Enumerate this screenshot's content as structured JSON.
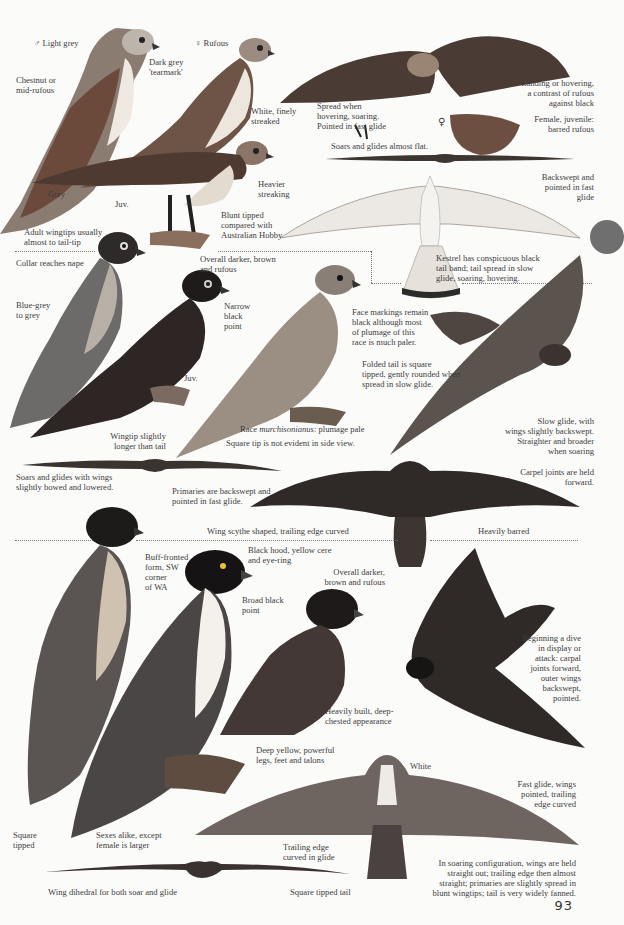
{
  "page": {
    "number": "93",
    "tab_color": "#6f6f6f",
    "ink_color": "#3c3c3c",
    "background": "#fbfbfa"
  },
  "section_kestrel": {
    "male_label": "♂ Light grey",
    "female_label": "♀ Rufous",
    "tearmark": "Dark grey\n'tearmark'",
    "chestnut": "Chestnut or\nmid-rufous",
    "white_streaked": "White, finely\nstreaked",
    "heavier_streaking": "Heavier\nstreaking",
    "grey": "Grey",
    "juv": "Juv.",
    "adult_wingtips": "Adult wingtips usually\nalmost to tail-tip",
    "blunt_tipped": "Blunt tipped\ncompared with\nAustralian Hobby",
    "spread_hovering": "Spread when\nhovering, soaring.\nPointed in fast glide",
    "female_symbol": "♀",
    "landing_hovering": "Landing or hovering,\na contrast of rufous\nagainst black",
    "female_juvenile": "Female, juvenile:\nbarred rufous",
    "soars_flat": "Soars and glides almost flat.",
    "backswept": "Backswept and\npointed in fast\nglide",
    "kestrel_tail": "Kestrel has conspicuous black\ntail band; tail spread in slow\nglide, soaring, hovering."
  },
  "section_hobby": {
    "collar": "Collar reaches nape",
    "overall_darker": "Overall darker, brown\nand rufous",
    "blue_grey": "Blue-grey\nto grey",
    "narrow_black_point": "Narrow\nblack\npoint",
    "juv": "Juv.",
    "face_markings": "Face markings remain\nblack although most\nof plumage of this\nrace is much paler.",
    "folded_tail": "Folded tail is square\ntipped, gently rounded when\nspread in slow glide.",
    "race_prefix": "Race ",
    "race_name": "murchisonianus",
    "race_suffix": ": plumage pale",
    "wingtip_longer": "Wingtip slightly\nlonger than tail",
    "square_tip": "Square tip is not evident in side view.",
    "slow_glide": "Slow glide, with\nwings slightly backswept.\nStraighter and broader\nwhen soaring",
    "soars_bowed": "Soars and glides with wings\nslightly bowed and lowered.",
    "primaries": "Primaries are backswept and\npointed in fast glide.",
    "carpel": "Carpel joints are held\nforward.",
    "scythe": "Wing scythe shaped, trailing edge curved",
    "heavily_barred": "Heavily barred"
  },
  "section_peregrine": {
    "buff_fronted": "Buff-fronted\nform, SW\ncorner\nof WA",
    "black_hood": "Black hood, yellow cere\nand eye-ring",
    "overall_darker": "Overall darker,\nbrown and rufous",
    "broad_black_point": "Broad black\npoint",
    "dive": "Beginning a dive\nin display or\nattack: carpal\njoints forward,\nouter wings\nbackswept,\npointed.",
    "juv": "Juv.",
    "heavily_built": "Heavily built, deep-\nchested appearance",
    "deep_yellow": "Deep yellow, powerful\nlegs, feet and talons",
    "white": "White",
    "fast_glide": "Fast glide, wings\npointed, trailing\nedge curved",
    "square_tipped": "Square\ntipped",
    "sexes_alike": "Sexes alike, except\nfemale is larger",
    "trailing_edge": "Trailing edge\ncurved in glide",
    "soaring_config": "In soaring configuration, wings are held\nstraight out; trailing edge then almost\nstraight; primaries are slightly spread in\nblunt wingtips; tail is very widely fanned.",
    "dihedral": "Wing dihedral for both soar and glide",
    "square_tail": "Square tipped tail"
  }
}
